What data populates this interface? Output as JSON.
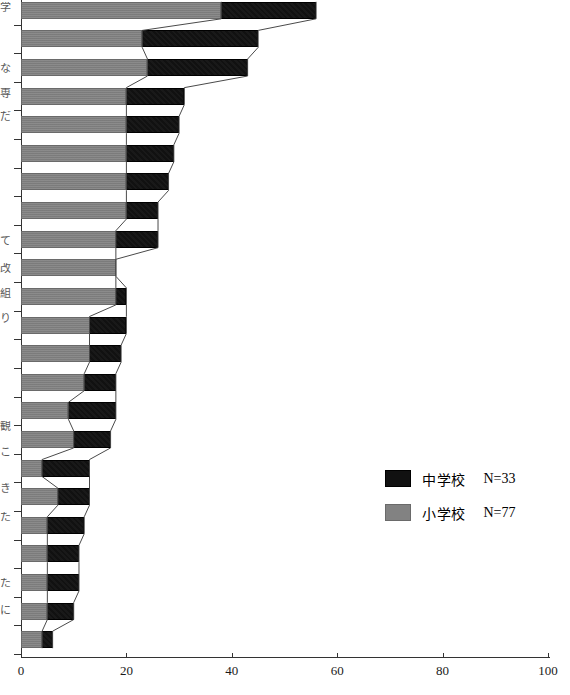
{
  "chart_data": {
    "type": "bar",
    "orientation": "horizontal",
    "title": "",
    "subtitle": "",
    "xlabel": "",
    "ylabel": "",
    "xlim": [
      0,
      100
    ],
    "xticks": [
      0,
      20,
      40,
      60,
      80,
      100
    ],
    "xtick_labels": [
      "0",
      "20",
      "40",
      "60",
      "80",
      "100"
    ],
    "grid": false,
    "legend_position": "center-right",
    "categories": [
      "item-1",
      "item-2",
      "item-3",
      "item-4",
      "item-5",
      "item-6",
      "item-7",
      "item-8",
      "item-9",
      "item-10",
      "item-11",
      "item-12",
      "item-13",
      "item-14",
      "item-15",
      "item-16",
      "item-17",
      "item-18",
      "item-19",
      "item-20",
      "item-21",
      "item-22",
      "item-23"
    ],
    "series": [
      {
        "name": "小学校",
        "color": "#828282",
        "n": 77,
        "values": [
          38,
          23,
          24,
          20,
          20,
          20,
          20,
          20,
          18,
          18,
          18,
          13,
          13,
          12,
          9,
          10,
          4,
          7,
          5,
          5,
          5,
          5,
          4
        ]
      },
      {
        "name": "中学校",
        "color": "#111111",
        "n": 33,
        "values": [
          56,
          45,
          43,
          31,
          30,
          29,
          28,
          26,
          26,
          18,
          20,
          20,
          19,
          18,
          18,
          17,
          13,
          13,
          12,
          11,
          11,
          10,
          6
        ]
      }
    ]
  },
  "legend": {
    "entries": [
      {
        "label": "中学校",
        "count_text": "N=33",
        "swatch": "black"
      },
      {
        "label": "小学校",
        "count_text": "N=77",
        "swatch": "gray"
      }
    ]
  },
  "cut_labels": [
    {
      "text": "学",
      "y": 2
    },
    {
      "text": "な",
      "y": 63
    },
    {
      "text": "専",
      "y": 88
    },
    {
      "text": "だ",
      "y": 111
    },
    {
      "text": "て",
      "y": 236
    },
    {
      "text": "改",
      "y": 263
    },
    {
      "text": "組",
      "y": 288
    },
    {
      "text": "り",
      "y": 313
    },
    {
      "text": "観",
      "y": 421
    },
    {
      "text": "こ",
      "y": 447
    },
    {
      "text": "き",
      "y": 483
    },
    {
      "text": "た",
      "y": 512
    },
    {
      "text": "た",
      "y": 578
    },
    {
      "text": "に",
      "y": 605
    }
  ]
}
